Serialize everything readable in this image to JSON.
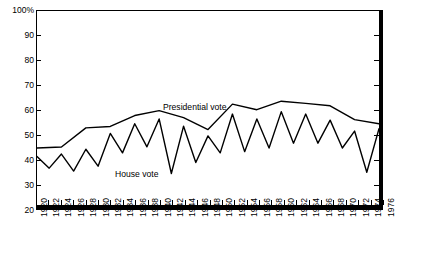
{
  "chart_data": {
    "type": "line",
    "title": "",
    "xlabel": "",
    "ylabel": "",
    "ylim": [
      20,
      100
    ],
    "ytick_labels": [
      "100%",
      "90",
      "80",
      "70",
      "60",
      "50",
      "40",
      "30",
      "20"
    ],
    "ytick_values": [
      100,
      90,
      80,
      70,
      60,
      50,
      40,
      30,
      20
    ],
    "grid": false,
    "legend_position": "inline-annotation",
    "x": [
      1920,
      1922,
      1924,
      1926,
      1928,
      1930,
      1932,
      1934,
      1936,
      1938,
      1940,
      1942,
      1944,
      1946,
      1948,
      1950,
      1952,
      1954,
      1956,
      1958,
      1960,
      1962,
      1964,
      1966,
      1968,
      1970,
      1972,
      1974,
      1976
    ],
    "xtick_labels": [
      "1920",
      "1922",
      "1924",
      "1926",
      "1928",
      "1930",
      "1932",
      "1934",
      "1936",
      "1938",
      "1940",
      "1942",
      "1944",
      "1946",
      "1948",
      "1950",
      "1952",
      "1954",
      "1956",
      "1958",
      "1960",
      "1962",
      "1964",
      "1966",
      "1968",
      "1970",
      "1972",
      "1974",
      "1976"
    ],
    "series": [
      {
        "name": "Presidential vote",
        "label": "Presidential vote",
        "color": "#000000",
        "x": [
          1920,
          1924,
          1928,
          1932,
          1936,
          1940,
          1944,
          1948,
          1952,
          1956,
          1960,
          1964,
          1968,
          1972,
          1976
        ],
        "values": [
          43.5,
          43.9,
          51.8,
          52.4,
          56.9,
          58.9,
          56.0,
          51.1,
          61.6,
          59.3,
          62.8,
          61.9,
          60.9,
          55.2,
          53.5
        ]
      },
      {
        "name": "House vote",
        "label": "House vote",
        "color": "#000000",
        "x": [
          1920,
          1922,
          1924,
          1926,
          1928,
          1930,
          1932,
          1934,
          1936,
          1938,
          1940,
          1942,
          1944,
          1946,
          1948,
          1950,
          1952,
          1954,
          1956,
          1958,
          1960,
          1962,
          1964,
          1966,
          1968,
          1970,
          1972,
          1974,
          1976
        ],
        "values": [
          40.0,
          35.2,
          41.0,
          34.0,
          43.0,
          36.0,
          49.5,
          41.5,
          53.5,
          44.0,
          55.5,
          33.0,
          52.5,
          37.5,
          48.5,
          41.5,
          57.5,
          42.0,
          55.5,
          43.5,
          58.5,
          45.5,
          57.5,
          45.5,
          55.0,
          43.5,
          50.5,
          33.5,
          51.5
        ]
      }
    ],
    "annotations": [
      {
        "text": "Presidential vote",
        "x": 1942,
        "y": 66
      },
      {
        "text": "House vote",
        "x": 1932,
        "y": 40
      }
    ]
  }
}
